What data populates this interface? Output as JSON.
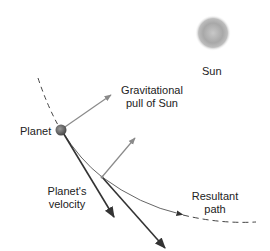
{
  "labels": {
    "sun": "Sun",
    "gravity_line1": "Gravitational",
    "gravity_line2": "pull of Sun",
    "planet": "Planet",
    "velocity_line1": "Planet's",
    "velocity_line2": "velocity",
    "path_line1": "Resultant",
    "path_line2": "path"
  },
  "colors": {
    "sun": "#9a9a9a",
    "gravity_arrow": "#8a8a8a",
    "velocity_arrow": "#333333",
    "orbit_path": "#444444",
    "planet": "#6a6a6a"
  }
}
